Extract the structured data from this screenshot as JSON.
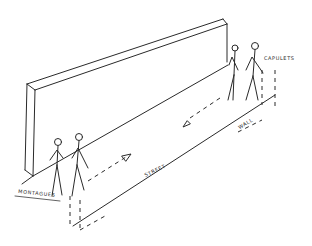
{
  "diagram": {
    "type": "stage-blocking-sketch",
    "style": "hand-drawn pencil",
    "ink_color": "#2a2a2a",
    "background": "#ffffff",
    "labels": {
      "left_group": "MONTAGUES",
      "right_group": "CAPULETS",
      "ground": "STREET",
      "barrier": "WALL"
    },
    "groups": [
      {
        "name": "MONTAGUES",
        "figures": 2,
        "position": "front-left",
        "movement": "toward right (upstage)"
      },
      {
        "name": "CAPULETS",
        "figures": 2,
        "position": "back-right",
        "movement": "toward left (downstage)"
      }
    ],
    "elements": [
      "long wall in perspective",
      "street plane",
      "two dashed movement arrows",
      "dashed dimension lines"
    ]
  }
}
